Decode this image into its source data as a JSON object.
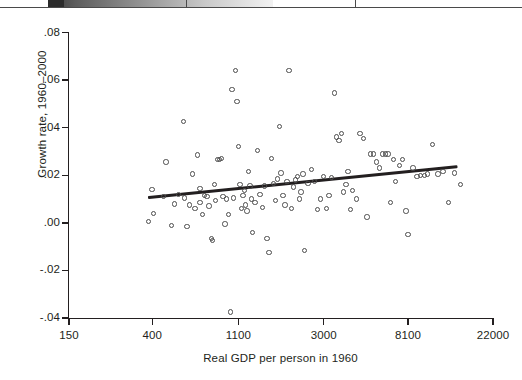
{
  "figure": {
    "page_edge": {
      "note": "cut-off strip from the page above the figure"
    }
  },
  "chart_data": {
    "type": "scatter",
    "title": "",
    "xlabel": "Real GDP per person in 1960",
    "ylabel": "Growth rate, 1960–2000",
    "x_scale": "log",
    "xticks": [
      150,
      400,
      1100,
      3000,
      8100,
      22000
    ],
    "xtick_labels": [
      "150",
      "400",
      "1100",
      "3000",
      "8100",
      "22000"
    ],
    "yticks": [
      0.08,
      0.06,
      0.04,
      0.02,
      0.0,
      -0.02,
      -0.04
    ],
    "ytick_labels": [
      ".08",
      ".06",
      ".04",
      ".02",
      ".00",
      "-.02",
      "-.04"
    ],
    "xlim": [
      150,
      22000
    ],
    "ylim": [
      -0.04,
      0.08
    ],
    "grid": false,
    "legend": null,
    "point_color": "#4c4c4c",
    "line_color": "#231f20",
    "trend": {
      "type": "linear-fit-on-log-x",
      "x_start": 380,
      "y_start": 0.0105,
      "x_end": 14500,
      "y_end": 0.0235,
      "description": "upward sloping regression line"
    },
    "points": [
      [
        382,
        0.0005
      ],
      [
        398,
        0.014
      ],
      [
        405,
        0.004
      ],
      [
        455,
        0.011
      ],
      [
        470,
        0.0255
      ],
      [
        500,
        -0.001
      ],
      [
        520,
        0.008
      ],
      [
        545,
        0.012
      ],
      [
        575,
        0.0425
      ],
      [
        585,
        0.0105
      ],
      [
        600,
        -0.0015
      ],
      [
        620,
        0.0075
      ],
      [
        640,
        0.0205
      ],
      [
        660,
        0.006
      ],
      [
        680,
        0.0285
      ],
      [
        700,
        0.0145
      ],
      [
        700,
        0.0085
      ],
      [
        720,
        0.0035
      ],
      [
        740,
        0.0115
      ],
      [
        760,
        0.011
      ],
      [
        780,
        0.007
      ],
      [
        800,
        -0.0065
      ],
      [
        810,
        -0.0075
      ],
      [
        830,
        0.016
      ],
      [
        840,
        0.0095
      ],
      [
        860,
        0.0265
      ],
      [
        880,
        0.0265
      ],
      [
        900,
        0.027
      ],
      [
        920,
        0.011
      ],
      [
        940,
        -0.0005
      ],
      [
        960,
        0.01
      ],
      [
        980,
        0.0035
      ],
      [
        1000,
        -0.0375
      ],
      [
        1020,
        0.056
      ],
      [
        1040,
        0.0105
      ],
      [
        1060,
        0.064
      ],
      [
        1080,
        0.051
      ],
      [
        1100,
        0.032
      ],
      [
        1120,
        0.016
      ],
      [
        1140,
        0.006
      ],
      [
        1160,
        0.0115
      ],
      [
        1180,
        0.0135
      ],
      [
        1200,
        0.0075
      ],
      [
        1220,
        0.005
      ],
      [
        1240,
        0.0215
      ],
      [
        1260,
        0.0155
      ],
      [
        1280,
        0.01
      ],
      [
        1300,
        -0.004
      ],
      [
        1340,
        0.0085
      ],
      [
        1380,
        0.0305
      ],
      [
        1420,
        0.012
      ],
      [
        1460,
        0.0065
      ],
      [
        1500,
        0.0155
      ],
      [
        1540,
        -0.0065
      ],
      [
        1580,
        -0.0125
      ],
      [
        1620,
        0.027
      ],
      [
        1660,
        0.0165
      ],
      [
        1700,
        0.0095
      ],
      [
        1740,
        0.0185
      ],
      [
        1780,
        0.0405
      ],
      [
        1820,
        0.021
      ],
      [
        1860,
        0.0115
      ],
      [
        1900,
        0.0075
      ],
      [
        1950,
        0.0175
      ],
      [
        2000,
        0.064
      ],
      [
        2050,
        0.006
      ],
      [
        2100,
        0.015
      ],
      [
        2150,
        0.018
      ],
      [
        2200,
        0.0195
      ],
      [
        2250,
        0.01
      ],
      [
        2300,
        0.013
      ],
      [
        2350,
        0.0205
      ],
      [
        2400,
        -0.0115
      ],
      [
        2500,
        0.0165
      ],
      [
        2600,
        0.0225
      ],
      [
        2700,
        0.0175
      ],
      [
        2800,
        0.0055
      ],
      [
        2900,
        0.01
      ],
      [
        3000,
        0.0195
      ],
      [
        3100,
        0.006
      ],
      [
        3200,
        0.0115
      ],
      [
        3300,
        0.019
      ],
      [
        3400,
        0.0545
      ],
      [
        3500,
        0.036
      ],
      [
        3600,
        0.0345
      ],
      [
        3700,
        0.0375
      ],
      [
        3800,
        0.013
      ],
      [
        3900,
        0.016
      ],
      [
        4000,
        0.0215
      ],
      [
        4100,
        0.0055
      ],
      [
        4200,
        0.0135
      ],
      [
        4400,
        0.01
      ],
      [
        4600,
        0.0375
      ],
      [
        4800,
        0.0355
      ],
      [
        5000,
        0.0025
      ],
      [
        5200,
        0.029
      ],
      [
        5400,
        0.029
      ],
      [
        5600,
        0.0255
      ],
      [
        5800,
        0.023
      ],
      [
        6000,
        0.029
      ],
      [
        6200,
        0.029
      ],
      [
        6400,
        0.029
      ],
      [
        6600,
        0.0085
      ],
      [
        6800,
        0.0265
      ],
      [
        7000,
        0.0175
      ],
      [
        7300,
        0.024
      ],
      [
        7600,
        0.0265
      ],
      [
        7900,
        0.005
      ],
      [
        8100,
        -0.005
      ],
      [
        8600,
        0.023
      ],
      [
        9000,
        0.0195
      ],
      [
        9400,
        0.02
      ],
      [
        9800,
        0.02
      ],
      [
        10200,
        0.0205
      ],
      [
        10800,
        0.033
      ],
      [
        11500,
        0.0205
      ],
      [
        12200,
        0.0215
      ],
      [
        13000,
        0.0085
      ],
      [
        14000,
        0.021
      ],
      [
        15000,
        0.016
      ]
    ]
  },
  "axes": {
    "ytick_labels": [
      ".08",
      ".06",
      ".04",
      ".02",
      ".00",
      "-.02",
      "-.04"
    ],
    "xtick_labels": [
      "150",
      "400",
      "1100",
      "3000",
      "8100",
      "22000"
    ],
    "xlabel": "Real GDP per person in 1960",
    "ylabel": "Growth rate, 1960–2000"
  }
}
